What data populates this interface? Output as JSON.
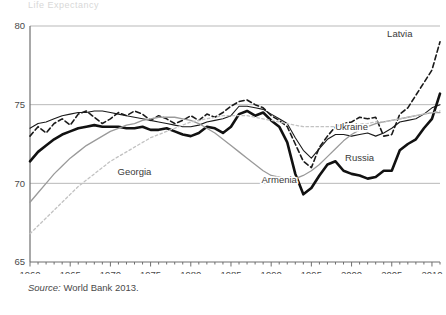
{
  "figure": {
    "top_partial_title": "Life Expectancy",
    "source_note_label": "Source:",
    "source_note_text": "World Bank 2013."
  },
  "chart_data": {
    "type": "line",
    "title": "Life Expectancy",
    "xlabel": "",
    "ylabel": "",
    "xlim": [
      1960,
      2011
    ],
    "ylim": [
      65,
      80
    ],
    "grid": true,
    "gridlines_y": [
      70,
      75,
      80
    ],
    "legend_position": "inline-annotations",
    "y_ticks": [
      "80",
      "75",
      "70",
      "65"
    ],
    "x_ticks": [
      "1960",
      "1965",
      "1970",
      "1975",
      "1980",
      "1985",
      "1990",
      "1995",
      "2000",
      "2005",
      "2010"
    ],
    "x": [
      1960,
      1961,
      1962,
      1963,
      1964,
      1965,
      1966,
      1967,
      1968,
      1969,
      1970,
      1971,
      1972,
      1973,
      1974,
      1975,
      1976,
      1977,
      1978,
      1979,
      1980,
      1981,
      1982,
      1983,
      1984,
      1985,
      1986,
      1987,
      1988,
      1989,
      1990,
      1991,
      1992,
      1993,
      1994,
      1995,
      1996,
      1997,
      1998,
      1999,
      2000,
      2001,
      2002,
      2003,
      2004,
      2005,
      2006,
      2007,
      2008,
      2009,
      2010,
      2011
    ],
    "series": [
      {
        "name": "Latvia",
        "style": "dashed",
        "color": "#1a1a1a",
        "width": 1.6,
        "label_x": 2006,
        "label_y": 79.3,
        "values": [
          73.0,
          73.6,
          73.2,
          73.8,
          74.1,
          73.7,
          74.4,
          74.6,
          74.2,
          73.8,
          74.1,
          74.5,
          74.3,
          74.6,
          74.4,
          74.0,
          74.3,
          74.1,
          73.8,
          74.0,
          74.3,
          74.0,
          74.4,
          74.2,
          74.5,
          74.9,
          75.2,
          75.3,
          75.0,
          74.8,
          74.3,
          74.0,
          73.6,
          72.5,
          71.4,
          71.0,
          72.3,
          73.0,
          73.6,
          73.8,
          73.9,
          74.2,
          74.1,
          74.2,
          73.0,
          73.1,
          74.4,
          74.8,
          75.6,
          76.4,
          77.2,
          79.0
        ]
      },
      {
        "name": "Ukraine",
        "style": "solid",
        "color": "#1a1a1a",
        "width": 1.1,
        "label_x": 2000,
        "label_y": 73.4,
        "values": [
          73.5,
          73.8,
          73.9,
          74.1,
          74.3,
          74.4,
          74.5,
          74.5,
          74.6,
          74.6,
          74.5,
          74.4,
          74.3,
          74.2,
          74.1,
          74.0,
          73.9,
          73.8,
          73.7,
          73.6,
          73.6,
          73.7,
          73.9,
          74.0,
          74.1,
          74.3,
          74.9,
          74.9,
          74.8,
          74.7,
          74.4,
          74.1,
          73.8,
          72.9,
          72.1,
          71.6,
          72.2,
          72.8,
          73.1,
          73.1,
          73.0,
          73.1,
          73.2,
          73.0,
          73.2,
          73.5,
          73.9,
          74.0,
          74.1,
          74.4,
          74.8,
          75.0
        ]
      },
      {
        "name": "Russia",
        "style": "solid",
        "color": "#111111",
        "width": 2.6,
        "label_x": 2001,
        "label_y": 71.4,
        "values": [
          71.4,
          72.0,
          72.4,
          72.8,
          73.1,
          73.3,
          73.5,
          73.6,
          73.7,
          73.6,
          73.6,
          73.6,
          73.5,
          73.5,
          73.6,
          73.4,
          73.4,
          73.5,
          73.3,
          73.1,
          73.0,
          73.2,
          73.6,
          73.5,
          73.2,
          73.6,
          74.4,
          74.6,
          74.3,
          74.5,
          74.0,
          73.6,
          72.6,
          70.6,
          69.3,
          69.7,
          70.5,
          71.2,
          71.4,
          70.8,
          70.6,
          70.5,
          70.3,
          70.4,
          70.8,
          70.8,
          72.1,
          72.5,
          72.8,
          73.5,
          74.1,
          75.7
        ]
      },
      {
        "name": "Armenia",
        "style": "solid",
        "color": "#9a9a9a",
        "width": 1.3,
        "label_x": 1991,
        "label_y": 70.0,
        "values": [
          68.8,
          69.4,
          70.0,
          70.6,
          71.1,
          71.6,
          72.0,
          72.4,
          72.7,
          73.0,
          73.3,
          73.5,
          73.7,
          73.8,
          74.0,
          74.1,
          74.2,
          74.2,
          74.2,
          74.1,
          74.0,
          73.8,
          73.5,
          73.2,
          72.8,
          72.4,
          72.0,
          71.6,
          71.2,
          70.8,
          70.5,
          70.4,
          70.3,
          70.3,
          70.5,
          70.8,
          71.2,
          71.7,
          72.2,
          72.7,
          73.1,
          73.4,
          73.6,
          73.8,
          73.9,
          74.0,
          74.1,
          74.2,
          74.3,
          74.4,
          74.5,
          74.5
        ]
      },
      {
        "name": "Georgia",
        "style": "dotted",
        "color": "#c2c2c2",
        "width": 1.3,
        "label_x": 1973,
        "label_y": 70.5,
        "values": [
          66.8,
          67.3,
          67.8,
          68.3,
          68.8,
          69.3,
          69.8,
          70.2,
          70.6,
          71.0,
          71.4,
          71.7,
          72.0,
          72.3,
          72.6,
          72.9,
          73.1,
          73.3,
          73.5,
          73.7,
          73.9,
          74.0,
          74.1,
          74.2,
          74.3,
          74.3,
          74.3,
          74.3,
          74.2,
          74.1,
          74.0,
          73.9,
          73.8,
          73.7,
          73.6,
          73.6,
          73.6,
          73.6,
          73.6,
          73.7,
          73.7,
          73.8,
          73.8,
          73.9,
          73.9,
          74.0,
          74.1,
          74.2,
          74.3,
          74.4,
          74.5,
          74.6
        ]
      }
    ]
  }
}
